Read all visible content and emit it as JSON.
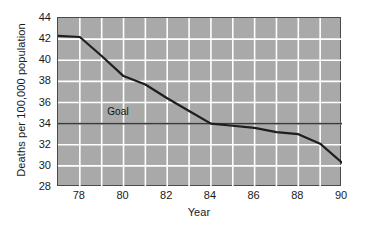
{
  "chart_data": {
    "type": "line",
    "title": "",
    "subtitle": "",
    "xlabel": "Year",
    "ylabel": "Deaths per 100,000 population",
    "xlim": [
      77,
      90
    ],
    "ylim": [
      28,
      44
    ],
    "xticks": [
      78,
      80,
      82,
      84,
      86,
      88,
      90
    ],
    "xtick_labels": [
      "78",
      "80",
      "82",
      "84",
      "86",
      "88",
      "90"
    ],
    "yticks": [
      28,
      30,
      32,
      34,
      36,
      38,
      40,
      42,
      44
    ],
    "ytick_labels": [
      "28",
      "30",
      "32",
      "34",
      "36",
      "38",
      "40",
      "42",
      "44"
    ],
    "grid": true,
    "grid_color": "#ffffff",
    "plot_background": "#a9a9a9",
    "legend": "none",
    "series": [
      {
        "name": "Observed death rate",
        "color": "#1e1e1e",
        "x": [
          77,
          78,
          79,
          80,
          81,
          82,
          83,
          84,
          85,
          86,
          87,
          88,
          89,
          90
        ],
        "values": [
          42.3,
          42.2,
          40.4,
          38.5,
          37.7,
          36.4,
          35.2,
          34.0,
          33.8,
          33.6,
          33.2,
          33.0,
          32.1,
          30.3
        ]
      },
      {
        "name": "Goal",
        "color": "#3c3c3c",
        "type": "hline",
        "value": 34.0,
        "x": [
          77,
          90
        ],
        "values": [
          34.0,
          34.0
        ]
      }
    ],
    "annotations": [
      {
        "text": "Goal",
        "x": 79.3,
        "y": 34.6
      }
    ]
  },
  "axes": {
    "y_title": "Deaths per 100,000 population",
    "x_title": "Year"
  },
  "labels": {
    "goal": "Goal"
  }
}
